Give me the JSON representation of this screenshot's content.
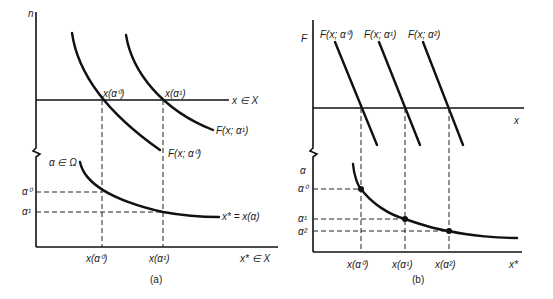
{
  "panel_a": {
    "caption": "(a)",
    "top_axis_label": "n",
    "x_line_label": "x ∈ X",
    "curve_label_1": "F(x; α¹)",
    "curve_label_0": "F(x; α⁰)",
    "intersect_label_0": "x(α⁰)",
    "intersect_label_1": "x(α¹)",
    "bottom_axis_label": "α ∈ Ω",
    "alpha_tick_0": "α⁰",
    "alpha_tick_1": "α¹",
    "curve_label_bottom": "x* = x(α)",
    "x_tick_0": "x(α⁰)",
    "x_tick_1": "x(α¹)",
    "x_axis_label": "x* ∈ X"
  },
  "panel_b": {
    "caption": "(b)",
    "top_axis_label": "F",
    "line_label_0": "F(x; α⁰)",
    "line_label_1": "F(x; α¹)",
    "line_label_2": "F(x; α²)",
    "x_line_label": "x",
    "bottom_axis_label": "α",
    "alpha_tick_0": "α⁰",
    "alpha_tick_1": "α¹",
    "alpha_tick_2": "α²",
    "x_tick_0": "x(α⁰)",
    "x_tick_1": "x(α¹)",
    "x_tick_2": "x(α²)",
    "x_axis_label": "x*"
  }
}
